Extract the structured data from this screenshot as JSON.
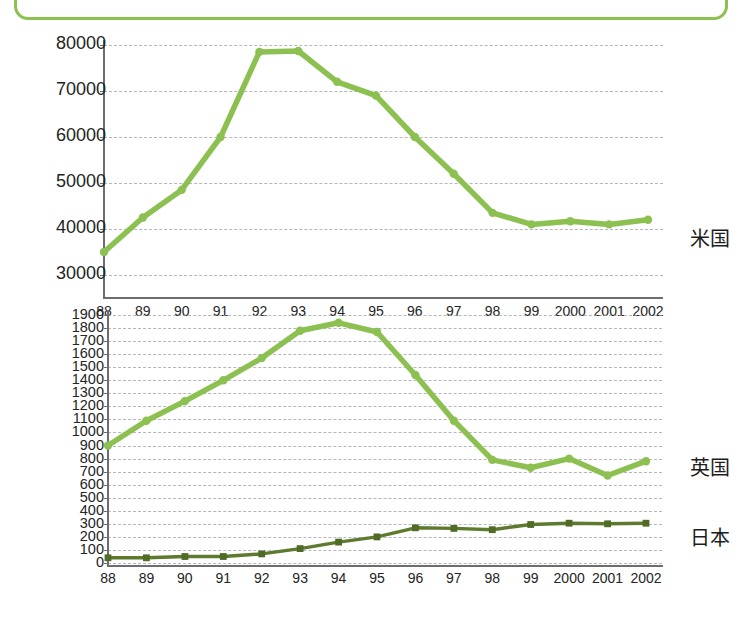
{
  "banner": {
    "top_right_text": "資料出所：各国統計"
  },
  "chart_data": [
    {
      "type": "line",
      "name": "us-chart",
      "title": "",
      "xlabel": "",
      "ylabel": "",
      "grid": true,
      "legend_position": "right",
      "ylim": [
        30000,
        80000
      ],
      "yticks": [
        80000,
        70000,
        60000,
        50000,
        40000,
        30000
      ],
      "categories": [
        "88",
        "89",
        "90",
        "91",
        "92",
        "93",
        "94",
        "95",
        "96",
        "97",
        "98",
        "99",
        "2000",
        "2001",
        "2002"
      ],
      "series": [
        {
          "name": "米国",
          "color": "#8cc152",
          "values": [
            35000,
            42500,
            48500,
            60000,
            78500,
            78700,
            72000,
            69000,
            60000,
            52000,
            43500,
            41000,
            41700,
            41000,
            42000
          ]
        }
      ]
    },
    {
      "type": "line",
      "name": "uk-japan-chart",
      "title": "",
      "xlabel": "",
      "ylabel": "",
      "grid": true,
      "legend_position": "right",
      "ylim": [
        0,
        1900
      ],
      "yticks": [
        1900,
        1800,
        1700,
        1600,
        1500,
        1400,
        1300,
        1200,
        1100,
        1000,
        900,
        800,
        700,
        600,
        500,
        400,
        300,
        200,
        100,
        0
      ],
      "categories": [
        "88",
        "89",
        "90",
        "91",
        "92",
        "93",
        "94",
        "95",
        "96",
        "97",
        "98",
        "99",
        "2000",
        "2001",
        "2002"
      ],
      "series": [
        {
          "name": "英国",
          "color": "#8cc152",
          "values": [
            900,
            1090,
            1240,
            1400,
            1570,
            1780,
            1840,
            1770,
            1440,
            1090,
            790,
            730,
            800,
            670,
            780
          ]
        },
        {
          "name": "日本",
          "color": "#5d7a2e",
          "values": [
            40,
            40,
            50,
            50,
            70,
            110,
            160,
            200,
            270,
            265,
            255,
            295,
            305,
            300,
            305
          ]
        }
      ]
    }
  ]
}
